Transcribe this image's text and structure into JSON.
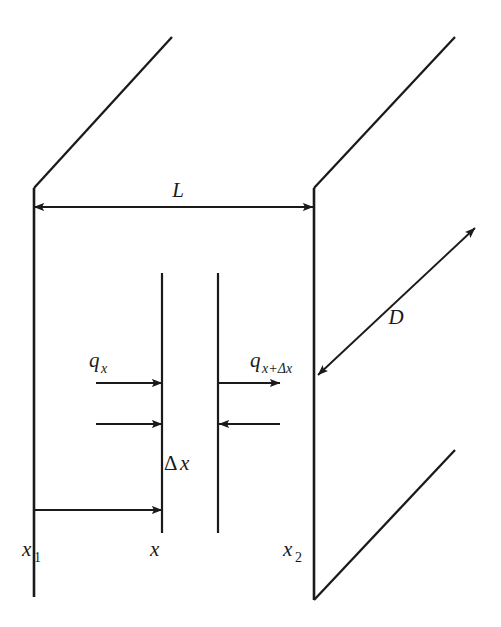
{
  "figure": {
    "kind": "heat-conduction-control-volume",
    "background_color": "#ffffff",
    "stroke_color": "#1a1a1a",
    "width": 501,
    "height": 627
  },
  "labels": {
    "length_L": "L",
    "depth_D": "D",
    "flux_in_base": "q",
    "flux_in_sub": "x",
    "flux_out_base": "q",
    "flux_out_sub": "x+Δx",
    "thickness_delta": "Δ",
    "thickness_var": "x",
    "pos_left_base": "x",
    "pos_left_sub": "1",
    "pos_mid": "x",
    "pos_right_base": "x",
    "pos_right_sub": "2"
  },
  "geometry": {
    "left_wall": {
      "x": 34,
      "y1": 188,
      "y2": 597
    },
    "right_wall": {
      "x": 314,
      "y1": 188,
      "y2": 600
    },
    "top_left_edge": {
      "x1": 34,
      "y1": 188,
      "x2": 172,
      "y2": 37
    },
    "top_right_edge": {
      "x1": 314,
      "y1": 188,
      "x2": 455,
      "y2": 37
    },
    "bottom_right_edge": {
      "x1": 314,
      "y1": 600,
      "x2": 455,
      "y2": 450
    },
    "inner_left_face": {
      "x": 162,
      "y1": 273,
      "y2": 533
    },
    "inner_right_face": {
      "x": 218,
      "y1": 273,
      "y2": 533
    },
    "dim_L": {
      "x1": 34,
      "x2": 313,
      "y": 207
    },
    "dim_D": {
      "x1": 318,
      "y1": 375,
      "x2": 475,
      "y2": 228
    },
    "flux_in_top": {
      "x1": 96,
      "x2": 162,
      "y": 383
    },
    "flux_in_mid": {
      "x1": 96,
      "x2": 162,
      "y": 424
    },
    "flux_out_top": {
      "x1": 219,
      "x2": 280,
      "y": 383
    },
    "flux_out_mid": {
      "x1": 280,
      "x2": 219,
      "y": 424
    },
    "pos_measure": {
      "x1": 34,
      "x2": 162,
      "y": 510
    }
  },
  "label_positions": {
    "length_L": {
      "x": 178,
      "y": 197
    },
    "depth_D": {
      "x": 396,
      "y": 324
    },
    "flux_in": {
      "x": 89,
      "y": 367
    },
    "flux_out": {
      "x": 250,
      "y": 367
    },
    "thickness": {
      "x": 174,
      "y": 470
    },
    "pos_left": {
      "x": 28,
      "y": 556
    },
    "pos_mid": {
      "x": 150,
      "y": 556
    },
    "pos_right": {
      "x": 289,
      "y": 556
    }
  }
}
